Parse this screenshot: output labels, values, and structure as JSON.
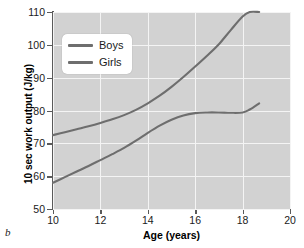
{
  "figure": {
    "panel_letter": "b"
  },
  "legend": {
    "position": "upper-left-inside",
    "entries": [
      {
        "label": "Boys",
        "color": "#6e6e6e"
      },
      {
        "label": "Girls",
        "color": "#6e6e6e"
      }
    ]
  },
  "style": {
    "plot_background": "#d2d2d2",
    "gridline_color": "#f4f4f4",
    "axis_color": "#5a5a5a",
    "line_color": "#6e6e6e",
    "page_background": "#ffffff"
  },
  "chart_data": {
    "type": "line",
    "title": "",
    "xlabel": "Age (years)",
    "ylabel": "10 sec work output (J/kg)",
    "xlim": [
      10,
      20
    ],
    "ylim": [
      50,
      110
    ],
    "xticks": [
      10,
      12,
      14,
      16,
      18,
      20
    ],
    "yticks": [
      50,
      60,
      70,
      80,
      90,
      100,
      110
    ],
    "xtick_labels": [
      "10",
      "12",
      "14",
      "16",
      "18",
      "20"
    ],
    "ytick_labels": [
      "50",
      "60",
      "70",
      "80",
      "90",
      "100",
      "110"
    ],
    "grid": true,
    "legend_position": "upper left",
    "series": [
      {
        "name": "Boys",
        "color": "#6e6e6e",
        "x": [
          10.0,
          10.5,
          11.0,
          11.5,
          12.0,
          12.5,
          13.0,
          13.5,
          14.0,
          14.5,
          15.0,
          15.5,
          16.0,
          16.5,
          17.0,
          17.5,
          18.0,
          18.3,
          18.7
        ],
        "y": [
          72.5,
          73.4,
          74.3,
          75.2,
          76.2,
          77.3,
          78.6,
          80.2,
          82.2,
          84.5,
          87.2,
          90.2,
          93.4,
          96.7,
          100.2,
          104.5,
          108.6,
          110.0,
          110.0
        ]
      },
      {
        "name": "Girls",
        "color": "#6e6e6e",
        "x": [
          10.0,
          10.5,
          11.0,
          11.5,
          12.0,
          12.5,
          13.0,
          13.5,
          14.0,
          14.5,
          15.0,
          15.5,
          16.0,
          16.5,
          17.0,
          17.5,
          18.0,
          18.3,
          18.7
        ],
        "y": [
          58.0,
          59.7,
          61.4,
          63.1,
          64.9,
          66.7,
          68.6,
          70.8,
          73.2,
          75.4,
          77.2,
          78.5,
          79.2,
          79.4,
          79.4,
          79.3,
          79.4,
          80.3,
          82.2
        ]
      }
    ]
  }
}
